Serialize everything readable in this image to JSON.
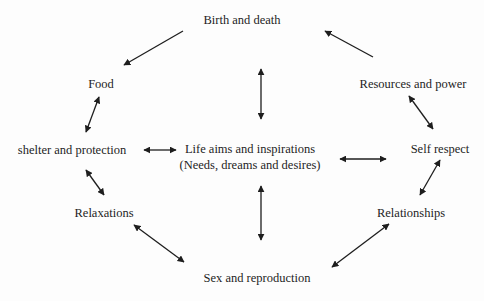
{
  "diagram": {
    "type": "concept-map",
    "center": {
      "line1": "Life aims and inspirations",
      "line2": "(Needs, dreams and desires)"
    },
    "nodes": {
      "birth_death": "Birth and death",
      "food": "Food",
      "shelter": "shelter and protection",
      "relaxations": "Relaxations",
      "sex_reproduction": "Sex and reproduction",
      "relationships": "Relationships",
      "self_respect": "Self respect",
      "resources_power": "Resources and power"
    },
    "edges": [
      {
        "from": "Birth and death",
        "to": "Food",
        "direction": "to"
      },
      {
        "from": "Resources and power",
        "to": "Birth and death",
        "direction": "to"
      },
      {
        "from": "Food",
        "to": "shelter and protection",
        "direction": "both"
      },
      {
        "from": "shelter and protection",
        "to": "Relaxations",
        "direction": "both"
      },
      {
        "from": "Relaxations",
        "to": "Sex and reproduction",
        "direction": "both"
      },
      {
        "from": "Sex and reproduction",
        "to": "Relationships",
        "direction": "both"
      },
      {
        "from": "Relationships",
        "to": "Self respect",
        "direction": "both"
      },
      {
        "from": "Self respect",
        "to": "Resources and power",
        "direction": "both"
      },
      {
        "from": "shelter and protection",
        "to": "Life aims and inspirations",
        "direction": "both"
      },
      {
        "from": "Life aims and inspirations",
        "to": "Self respect",
        "direction": "both"
      },
      {
        "from": "Birth and death",
        "to": "Life aims and inspirations",
        "direction": "both"
      },
      {
        "from": "Life aims and inspirations",
        "to": "Sex and reproduction",
        "direction": "both"
      }
    ],
    "colors": {
      "text": "#1e1e1e",
      "arrow": "#1e1e1e",
      "background": "#ffffff"
    }
  }
}
